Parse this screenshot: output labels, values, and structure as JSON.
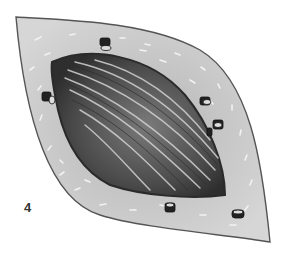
{
  "figure": {
    "label": "4",
    "colors": {
      "background": "#ffffff",
      "skin": "#c8c8c8",
      "skin_outline": "#555555",
      "wound_dark": "#3a3a3a",
      "wound_mid": "#6e6e6e",
      "fiber_highlight": "#d8d8d8",
      "clamp": "#222222"
    },
    "clamp_count": 7
  }
}
